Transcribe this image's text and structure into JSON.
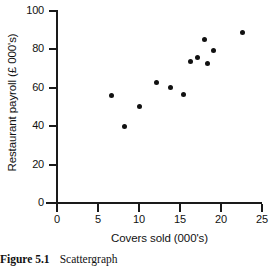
{
  "figure": {
    "caption_number": "Figure 5.1",
    "caption_text": "Scattergraph"
  },
  "chart_data": {
    "type": "scatter",
    "title": "",
    "xlabel": "Covers sold (000's)",
    "ylabel": "Restaurant payroll (£ 000's)",
    "xlim": [
      0,
      25
    ],
    "ylim": [
      0,
      100
    ],
    "xticks": [
      0,
      5,
      10,
      15,
      20,
      25
    ],
    "yticks": [
      0,
      20,
      40,
      60,
      80,
      100
    ],
    "xtick_labels": [
      "0",
      "5",
      "10",
      "15",
      "20",
      "25"
    ],
    "ytick_labels": [
      "0",
      "20",
      "40",
      "60",
      "80",
      "100"
    ],
    "grid": false,
    "legend": false,
    "marker": "filled-circle",
    "marker_color": "#111111",
    "points": [
      {
        "x": 6.6,
        "y": 56.0
      },
      {
        "x": 8.2,
        "y": 40.0
      },
      {
        "x": 10.0,
        "y": 50.5
      },
      {
        "x": 12.1,
        "y": 63.0
      },
      {
        "x": 13.8,
        "y": 60.0
      },
      {
        "x": 15.4,
        "y": 56.5
      },
      {
        "x": 16.3,
        "y": 73.5
      },
      {
        "x": 17.1,
        "y": 76.0
      },
      {
        "x": 18.0,
        "y": 85.0
      },
      {
        "x": 18.3,
        "y": 72.5
      },
      {
        "x": 19.1,
        "y": 79.5
      },
      {
        "x": 22.6,
        "y": 89.0
      }
    ]
  }
}
